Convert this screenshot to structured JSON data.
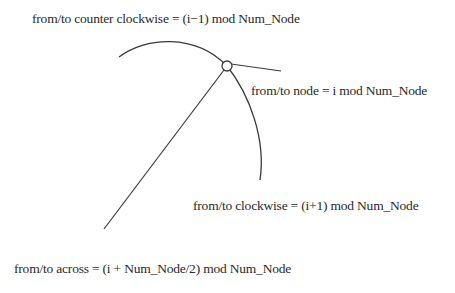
{
  "diagram": {
    "labels": {
      "counter_clockwise": "from/to counter clockwise = (i−1) mod Num_Node",
      "node": "from/to node = i mod Num_Node",
      "clockwise": "from/to clockwise = (i+1) mod Num_Node",
      "across": "from/to across = (i + Num_Node/2) mod Num_Node"
    },
    "elements": {
      "ring_arc": "ring-arc",
      "node": "node-i",
      "link_outward": "link-outward",
      "link_across": "link-across"
    },
    "colors": {
      "stroke": "#3a3a3a",
      "text": "#2a2a2a",
      "background": "#ffffff"
    }
  }
}
